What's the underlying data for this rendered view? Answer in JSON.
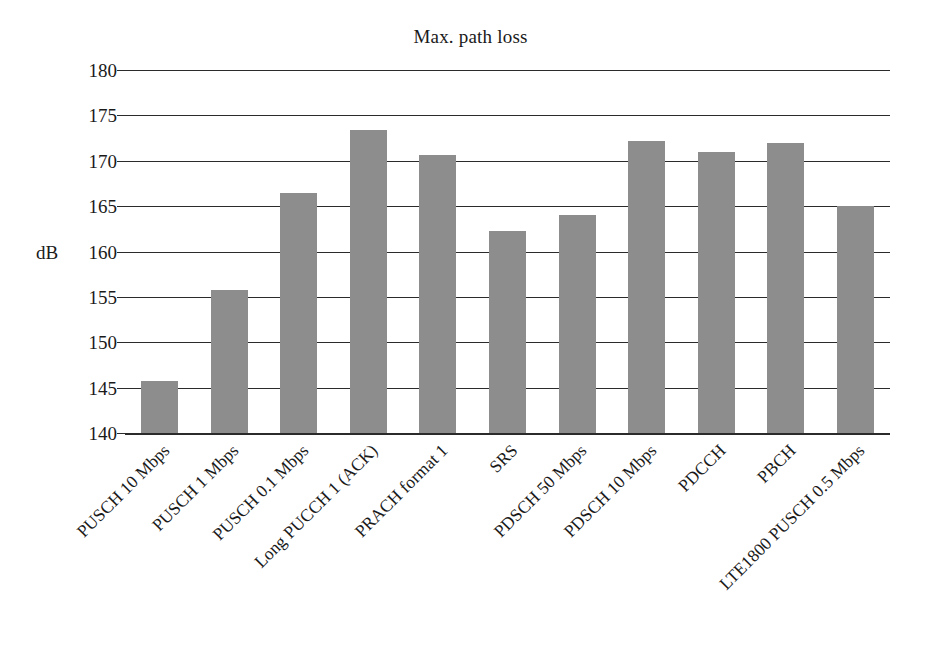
{
  "chart_data": {
    "type": "bar",
    "title": "Max. path loss",
    "xlabel": "",
    "ylabel": "dB",
    "ylim": [
      140,
      180
    ],
    "ytick_step": 5,
    "yticks": [
      180,
      175,
      170,
      165,
      160,
      155,
      150,
      145,
      140
    ],
    "grid": true,
    "legend": "none",
    "bar_color": "#8d8d8d",
    "axis_color": "#2b2b2b",
    "categories": [
      "PUSCH 10 Mbps",
      "PUSCH 1 Mbps",
      "PUSCH 0.1 Mbps",
      "Long PUCCH 1 (ACK)",
      "PRACH format 1",
      "SRS",
      "PDSCH 50 Mbps",
      "PDSCH 10 Mbps",
      "PDCCH",
      "PBCH",
      "LTE1800 PUSCH 0.5 Mbps"
    ],
    "values": [
      145.7,
      155.8,
      166.4,
      173.4,
      170.6,
      162.3,
      164.0,
      172.2,
      171.0,
      172.0,
      165.0
    ],
    "series": [
      {
        "name": "Max. path loss",
        "values": [
          145.7,
          155.8,
          166.4,
          173.4,
          170.6,
          162.3,
          164.0,
          172.2,
          171.0,
          172.0,
          165.0
        ]
      }
    ]
  }
}
